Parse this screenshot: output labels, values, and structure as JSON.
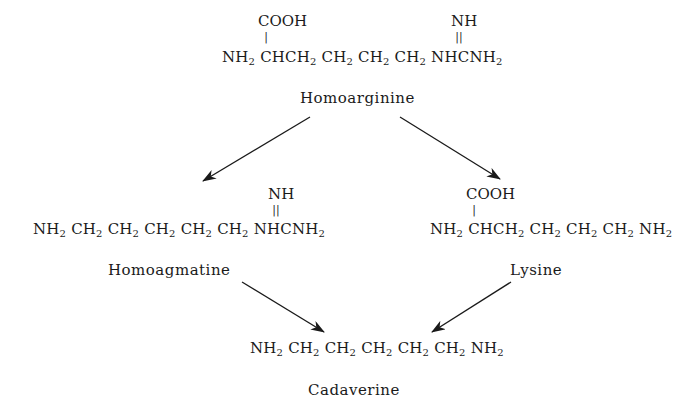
{
  "diagram": {
    "compounds": [
      {
        "id": "homoarginine",
        "name": "Homoarginine",
        "substituent_left": "COOH",
        "substituent_right": "NH",
        "formula_parts": [
          "NH",
          "2",
          " CHCH",
          "2",
          " CH",
          "2",
          " CH",
          "2",
          " CH",
          "2",
          " NHCNH",
          "2"
        ]
      },
      {
        "id": "homoagmatine",
        "name": "Homoagmatine",
        "substituent_right": "NH",
        "formula_parts": [
          "NH",
          "2",
          " CH",
          "2",
          " CH",
          "2",
          " CH",
          "2",
          " CH",
          "2",
          " CH",
          "2",
          " NHCNH",
          "2"
        ]
      },
      {
        "id": "lysine",
        "name": "Lysine",
        "substituent_left": "COOH",
        "formula_parts": [
          "NH",
          "2",
          " CHCH",
          "2",
          " CH",
          "2",
          " CH",
          "2",
          " CH",
          "2",
          " NH",
          "2"
        ]
      },
      {
        "id": "cadaverine",
        "name": "Cadaverine",
        "formula_parts": [
          "NH",
          "2",
          " CH",
          "2",
          " CH",
          "2",
          " CH",
          "2",
          " CH",
          "2",
          " CH",
          "2",
          " NH",
          "2"
        ]
      }
    ],
    "arrows": [
      {
        "from": "homoarginine",
        "to": "homoagmatine"
      },
      {
        "from": "homoarginine",
        "to": "lysine"
      },
      {
        "from": "homoagmatine",
        "to": "cadaverine"
      },
      {
        "from": "lysine",
        "to": "cadaverine"
      }
    ],
    "bonds": {
      "single": "|",
      "double": "||"
    }
  }
}
